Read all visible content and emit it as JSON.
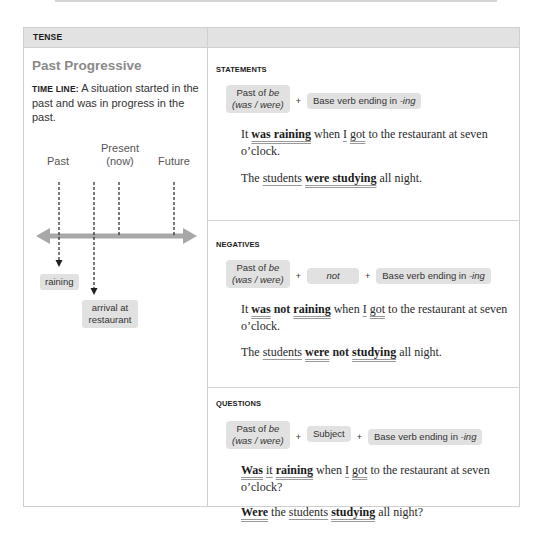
{
  "header": {
    "left_label": "TENSE",
    "right_label": ""
  },
  "tense": {
    "title": "Past Progressive",
    "timeline_label": "TIME LINE:",
    "timeline_description": "A situation started in the past and was in progress in the past.",
    "timeline": {
      "past": "Past",
      "present_line1": "Present",
      "present_line2": "(now)",
      "future": "Future",
      "event1": "raining",
      "event2_line1": "arrival at",
      "event2_line2": "restaurant"
    }
  },
  "statements": {
    "title": "STATEMENTS",
    "formula": {
      "box1_line1": "Past of ",
      "box1_be": "be",
      "box1_line2": "(was / were)",
      "plus": "+",
      "box2": "Base verb ending in ",
      "box2_ing": "-ing"
    },
    "ex1": {
      "t1": "It ",
      "v1": "was raining",
      "t2": " when ",
      "s1": "I",
      "t3": " ",
      "v2": "got",
      "t4": " to the restaurant at seven o’clock."
    },
    "ex2": {
      "t1": "The ",
      "s1": "students",
      "t2": " ",
      "v1": "were studying",
      "t3": " all night."
    }
  },
  "negatives": {
    "title": "NEGATIVES",
    "formula": {
      "box1_line1": "Past of ",
      "box1_be": "be",
      "box1_line2": "(was / were)",
      "plus": "+",
      "box_not": "not",
      "box2": "Base verb ending in ",
      "box2_ing": "-ing"
    },
    "ex1": {
      "t1": "It ",
      "v1": "was",
      "t2": " ",
      "neg": "not",
      "t3": " ",
      "v2": "raining",
      "t4": " when ",
      "s1": "I",
      "t5": " ",
      "v3": "got",
      "t6": " to the restaurant at seven o’clock."
    },
    "ex2": {
      "t1": "The ",
      "s1": "students",
      "t2": " ",
      "v1": "were",
      "t3": " ",
      "neg": "not",
      "t4": " ",
      "v2": "studying",
      "t5": " all night."
    }
  },
  "questions": {
    "title": "QUESTIONS",
    "formula": {
      "box1_line1": "Past of ",
      "box1_be": "be",
      "box1_line2": "(was / were)",
      "plus": "+",
      "box_subject": "Subject",
      "box2": "Base verb ending in ",
      "box2_ing": "-ing"
    },
    "ex1": {
      "v1": "Was",
      "t1": " ",
      "s1": "it",
      "t2": " ",
      "v2": "raining",
      "t3": " when ",
      "s2": "I",
      "t4": " ",
      "v3": "got",
      "t5": " to the restaurant at seven o’clock?"
    },
    "ex2": {
      "v1": "Were",
      "t1": " the ",
      "s1": "students",
      "t2": " ",
      "v2": "studying",
      "t3": " all night?"
    }
  },
  "colors": {
    "header_bg": "#e2e2e2",
    "box_bg": "#e1e1e1",
    "title_gray": "#8a8a8a",
    "arrow_gray": "#a8a8a8",
    "border": "#cfcfcf"
  }
}
